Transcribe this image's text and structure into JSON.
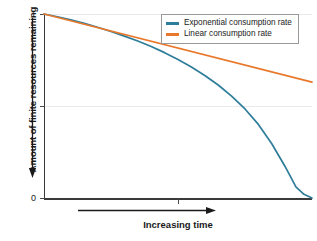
{
  "chart_data": {
    "type": "line",
    "title": "",
    "xlabel": "Increasing time",
    "ylabel": "Amount of finite resources remaining",
    "xlim": [
      0,
      1
    ],
    "ylim": [
      0,
      1
    ],
    "grid": true,
    "grid_axis": "y",
    "legend_position": "top-right",
    "x_tick_labels": [],
    "y_tick_labels": [
      "1",
      "0"
    ],
    "y_ticks": [
      1,
      0.5,
      0
    ],
    "x_ticks": [
      0,
      0.5,
      1
    ],
    "x_axis_arrow": "right",
    "y_axis_arrow": "down",
    "series": [
      {
        "name": "Exponential consumption rate",
        "color": "#2e7d9a",
        "x": [
          0.0,
          0.05,
          0.1,
          0.15,
          0.2,
          0.25,
          0.3,
          0.35,
          0.4,
          0.45,
          0.5,
          0.55,
          0.6,
          0.65,
          0.7,
          0.75,
          0.8,
          0.85,
          0.9,
          0.94,
          0.97,
          1.0
        ],
        "y": [
          1.0,
          0.985,
          0.968,
          0.949,
          0.928,
          0.905,
          0.88,
          0.853,
          0.823,
          0.79,
          0.753,
          0.712,
          0.666,
          0.614,
          0.554,
          0.484,
          0.4,
          0.295,
          0.17,
          0.06,
          0.02,
          0.0
        ]
      },
      {
        "name": "Linear consumption rate",
        "color": "#e8782c",
        "x": [
          0.0,
          1.0
        ],
        "y": [
          1.0,
          0.63
        ]
      }
    ],
    "legend": [
      {
        "label": "Exponential consumption rate",
        "color": "#2e7d9a"
      },
      {
        "label": "Linear consumption rate",
        "color": "#e8782c"
      }
    ],
    "colors": {
      "exponential": "#2e7d9a",
      "linear": "#e8782c",
      "axis": "#3a3a3a",
      "grid": "#eaeaea",
      "text": "#1a1a1a",
      "background": "#ffffff"
    }
  },
  "axes": {
    "y_top_label": "1",
    "y_bottom_label": "0"
  }
}
